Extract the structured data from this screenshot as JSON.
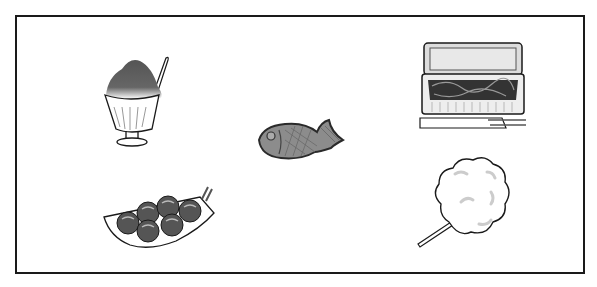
{
  "illustration": {
    "title": "Japanese festival foods",
    "items": [
      {
        "id": "kakigori",
        "label": "Shaved ice (kakigori)"
      },
      {
        "id": "yakisoba",
        "label": "Yakisoba in takeout box"
      },
      {
        "id": "taiyaki",
        "label": "Taiyaki"
      },
      {
        "id": "takoyaki",
        "label": "Takoyaki"
      },
      {
        "id": "cotton-candy",
        "label": "Cotton candy"
      }
    ],
    "colors": {
      "outline": "#1a1a1a",
      "dark_gray": "#555555",
      "mid_gray": "#8a8a8a",
      "light_gray": "#cccccc",
      "background": "#ffffff"
    }
  }
}
